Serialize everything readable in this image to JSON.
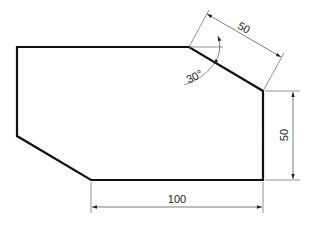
{
  "drawing": {
    "type": "technical-dimension-drawing",
    "dimensions": {
      "bottom_width": "100",
      "right_height": "50",
      "chamfer_length": "50",
      "chamfer_angle": "30°"
    },
    "colors": {
      "outline": "#111111",
      "dimension_line": "#555555",
      "background": "#ffffff"
    }
  }
}
